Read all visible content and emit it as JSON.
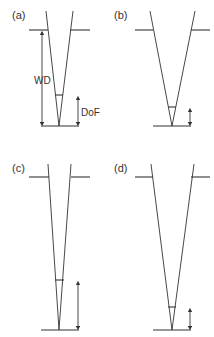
{
  "figure": {
    "panels": [
      {
        "id": "a",
        "label": "(a)",
        "annotations": {
          "working_distance": "WD",
          "depth_of_field": "DoF"
        }
      },
      {
        "id": "b",
        "label": "(b)"
      },
      {
        "id": "c",
        "label": "(c)"
      },
      {
        "id": "d",
        "label": "(d)"
      }
    ],
    "line_color": "#333333",
    "background": "#ffffff"
  }
}
